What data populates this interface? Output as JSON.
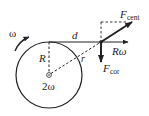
{
  "diagram": {
    "labels": {
      "omega": "ω",
      "d": "d",
      "R": "R",
      "r": "r",
      "two_omega": "2ω",
      "F_cent_main": "F",
      "F_cent_sub": "cent",
      "R_omega": "Rω",
      "F_cor_main": "F",
      "F_cor_sub": "cor"
    },
    "colors": {
      "stroke": "#222222",
      "background": "#ffffff"
    }
  }
}
